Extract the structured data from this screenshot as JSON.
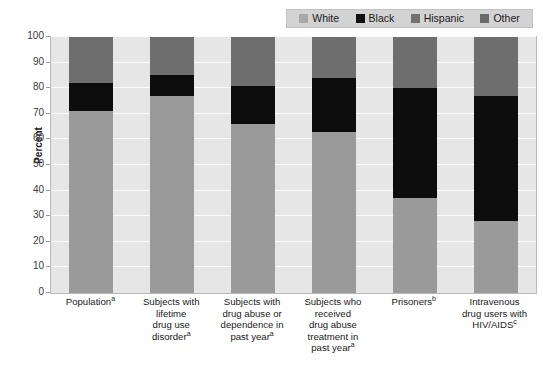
{
  "chart_data": {
    "type": "bar",
    "stacked": true,
    "title": "",
    "xlabel": "",
    "ylabel": "Percent",
    "ylim": [
      0,
      100
    ],
    "yticks": [
      0,
      10,
      20,
      30,
      40,
      50,
      60,
      70,
      80,
      90,
      100
    ],
    "grid": true,
    "legend_position": "top-right",
    "categories": [
      "Populationᵃ",
      "Subjects with lifetime drug use disorderᵃ",
      "Subjects with drug abuse or dependence in past yearᵃ",
      "Subjects who received drug abuse treatment in past yearᵃ",
      "Prisonersᵇ",
      "Intravenous drug users with HIV/AIDSᶜ"
    ],
    "category_lines": [
      [
        "Population",
        "a"
      ],
      [
        "Subjects with",
        "lifetime",
        "drug use",
        "disorder",
        "a"
      ],
      [
        "Subjects with",
        "drug abuse or",
        "dependence in",
        "past year",
        "a"
      ],
      [
        "Subjects who",
        "received",
        "drug abuse",
        "treatment in",
        "past year",
        "a"
      ],
      [
        "Prisoners",
        "b"
      ],
      [
        "Intravenous",
        "drug users with",
        "HIV/AIDS",
        "c"
      ]
    ],
    "series": [
      {
        "name": "White",
        "color": "#9a9a9a",
        "values": [
          71,
          77,
          66,
          63,
          37,
          28
        ]
      },
      {
        "name": "Black",
        "color": "#0d0d0d",
        "values": [
          11,
          8,
          15,
          21,
          43,
          49
        ]
      },
      {
        "name": "Hispanic",
        "color": "#6e6e6e",
        "values": [
          12,
          10,
          13,
          11,
          15,
          17
        ]
      },
      {
        "name": "Other",
        "color": "#6e6e6e",
        "values": [
          6,
          5,
          6,
          5,
          5,
          6
        ]
      }
    ]
  },
  "legend": {
    "items": [
      {
        "label": "White",
        "color": "#a8a8a8"
      },
      {
        "label": "Black",
        "color": "#101010"
      },
      {
        "label": "Hispanic",
        "color": "#707070"
      },
      {
        "label": "Other",
        "color": "#6a6a6a"
      }
    ]
  },
  "axis": {
    "y_title": "Percent"
  }
}
